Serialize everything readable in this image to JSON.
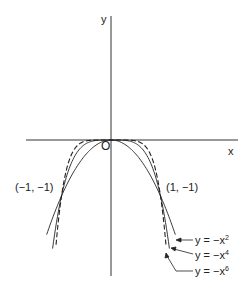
{
  "chart_data": {
    "type": "line",
    "title": "",
    "xlabel": "x",
    "ylabel": "y",
    "origin_label": "O",
    "xlim": [
      -1.1,
      1.3
    ],
    "ylim": [
      -2.0,
      2.5
    ],
    "grid": false,
    "series": [
      {
        "name": "y = -x^2",
        "style": "solid",
        "x": [
          -1.3,
          -1,
          -0.5,
          0,
          0.5,
          1,
          1.3
        ],
        "y": [
          -1.69,
          -1,
          -0.25,
          0,
          -0.25,
          -1,
          -1.69
        ]
      },
      {
        "name": "y = -x^4",
        "style": "solid",
        "x": [
          -1.18,
          -1,
          -0.5,
          0,
          0.5,
          1,
          1.18
        ],
        "y": [
          -1.94,
          -1,
          -0.0625,
          0,
          -0.0625,
          -1,
          -1.94
        ]
      },
      {
        "name": "y = -x^6",
        "style": "dashed",
        "x": [
          -1.11,
          -1,
          -0.5,
          0,
          0.5,
          1,
          1.11
        ],
        "y": [
          -1.87,
          -1,
          -0.0156,
          0,
          -0.0156,
          -1,
          -1.87
        ]
      }
    ],
    "annotations": [
      {
        "text": "(-1, -1)",
        "x": -1,
        "y": -1
      },
      {
        "text": "(1, -1)",
        "x": 1,
        "y": -1
      }
    ]
  },
  "labels": {
    "y_axis": "y",
    "x_axis": "x",
    "origin": "O",
    "point_left": "(−1, −1)",
    "point_right": "(1, −1)",
    "legend": [
      {
        "prefix": "y = −x",
        "exp": "2"
      },
      {
        "prefix": "y = −x",
        "exp": "4"
      },
      {
        "prefix": "y = −x",
        "exp": "6"
      }
    ]
  }
}
